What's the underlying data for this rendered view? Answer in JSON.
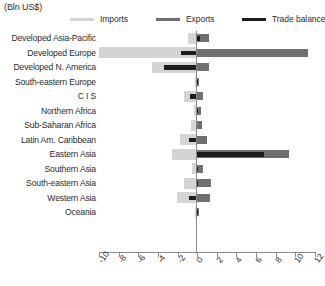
{
  "header": {
    "units_label": "(Bln US$)"
  },
  "legend": {
    "position": "top",
    "items": [
      {
        "label": "Imports",
        "color": "#d4d4d4",
        "key": "imports"
      },
      {
        "label": "Exports",
        "color": "#6f6f6f",
        "key": "exports"
      },
      {
        "label": "Trade balance",
        "color": "#1c1c1c",
        "key": "balance"
      }
    ]
  },
  "axis": {
    "ticks": [
      -10,
      -8,
      -6,
      -4,
      -2,
      0,
      2,
      4,
      6,
      8,
      10,
      12
    ],
    "tick_labels": [
      "-10",
      "-8",
      "-6",
      "-4",
      "-2",
      "0",
      "2",
      "4",
      "6",
      "8",
      "10",
      "12"
    ],
    "min": -10,
    "max": 12
  },
  "chart_data": {
    "type": "bar",
    "orientation": "horizontal",
    "title": "",
    "subtitle": "",
    "xlabel": "(Bln US$)",
    "ylabel": "",
    "xlim": [
      -10,
      12
    ],
    "grid": false,
    "legend_position": "top",
    "categories": [
      "Developed Asia-Pacific",
      "Developed Europe",
      "Developed N. America",
      "South-eastern Europe",
      "C I S",
      "Northern Africa",
      "Sub-Saharan Africa",
      "Latin Am. Caribbean",
      "Eastern Asia",
      "Southern Asia",
      "South-eastern Asia",
      "Western Asia",
      "Oceania"
    ],
    "series": [
      {
        "name": "Imports",
        "color": "#d4d4d4",
        "values": [
          -0.9,
          -10.0,
          -4.6,
          -0.2,
          -1.3,
          -0.3,
          -0.6,
          -1.8,
          -2.6,
          -0.5,
          -1.3,
          -2.1,
          -0.2
        ]
      },
      {
        "name": "Exports",
        "color": "#6f6f6f",
        "values": [
          1.2,
          11.3,
          1.2,
          0.2,
          0.6,
          0.4,
          0.5,
          1.0,
          9.4,
          0.6,
          1.4,
          1.3,
          0.2
        ]
      },
      {
        "name": "Trade balance",
        "color": "#1c1c1c",
        "values": [
          0.3,
          -1.6,
          -3.4,
          0.0,
          -0.7,
          0.1,
          -0.1,
          -0.8,
          6.8,
          0.1,
          0.1,
          -0.8,
          0.0
        ]
      }
    ]
  }
}
